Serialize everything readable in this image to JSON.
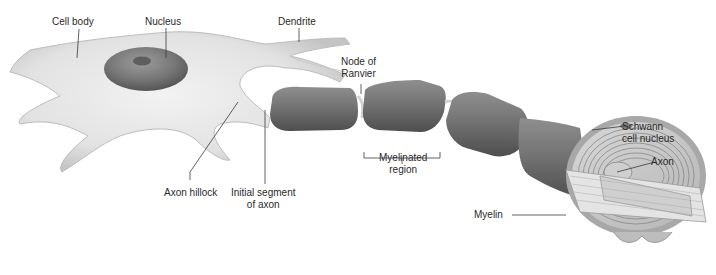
{
  "diagram": {
    "labels": {
      "cell_body": "Cell body",
      "nucleus": "Nucleus",
      "dendrite": "Dendrite",
      "node_of_ranvier_line1": "Node of",
      "node_of_ranvier_line2": "Ranvier",
      "schwann_cell_nucleus_line1": "Schwann",
      "schwann_cell_nucleus_line2": "cell nucleus",
      "axon": "Axon",
      "myelin": "Myelin",
      "myelinated_region_line1": "Myelinated",
      "myelinated_region_line2": "region",
      "axon_hillock": "Axon hillock",
      "initial_segment_line1": "Initial segment",
      "initial_segment_line2": "of axon"
    },
    "colors": {
      "cell_fill": "#e6e6e6",
      "cell_shadow": "#b8b8b8",
      "nucleus": "#7a7a7a",
      "myelin_segment": "#6f6f6f",
      "myelin_highlight": "#9a9a9a",
      "leader_line": "#3a3a3a",
      "text": "#2a2a2a"
    }
  }
}
